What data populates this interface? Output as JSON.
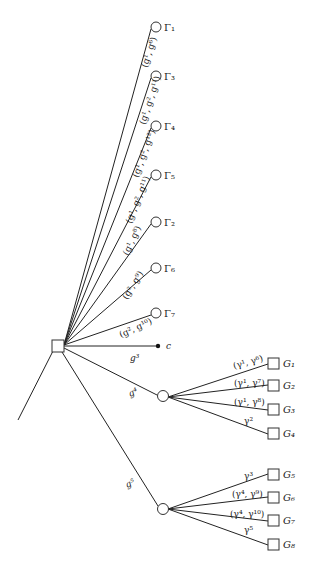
{
  "diagram": {
    "type": "game-tree",
    "root": {
      "shape": "square"
    },
    "top_branches": [
      {
        "label": "(g¹, g⁶)",
        "leaf": "Γ₁"
      },
      {
        "label": "(g¹, g², g¹¹)",
        "leaf": "Γ₃"
      },
      {
        "label": "(g¹, g², g¹²)",
        "leaf": "Γ₄"
      },
      {
        "label": "(g¹, g², g¹¹)",
        "leaf": "Γ₅"
      },
      {
        "label": "(g¹, g⁸)",
        "leaf": "Γ₂"
      },
      {
        "label": "(g², g⁹)",
        "leaf": "Γ₆"
      },
      {
        "label": "(g², g¹⁰)",
        "leaf": "Γ₇"
      }
    ],
    "terminal_branch": {
      "label": "g³",
      "leaf": "c"
    },
    "chance_branches": [
      {
        "label": "g⁴",
        "children": [
          {
            "label": "(γ¹, γ⁶)",
            "leaf": "G₁"
          },
          {
            "label": "(γ¹, γ⁷)",
            "leaf": "G₂"
          },
          {
            "label": "(γ¹, γ⁸)",
            "leaf": "G₃"
          },
          {
            "label": "γ²",
            "leaf": "G₄"
          }
        ]
      },
      {
        "label": "g⁵",
        "children": [
          {
            "label": "γ³",
            "leaf": "G₅"
          },
          {
            "label": "(γ⁴, γ⁹)",
            "leaf": "G₆"
          },
          {
            "label": "(γ⁴, γ¹⁰)",
            "leaf": "G₇"
          },
          {
            "label": "γ⁵",
            "leaf": "G₈"
          }
        ]
      }
    ]
  }
}
